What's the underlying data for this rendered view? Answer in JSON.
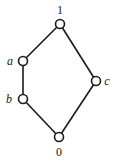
{
  "diagram": {
    "type": "hasse-diagram",
    "nodes": [
      {
        "id": "1",
        "label": "1",
        "x": 60,
        "y": 24,
        "lx": 60,
        "ly": 14,
        "italic": false
      },
      {
        "id": "a",
        "label": "a",
        "x": 23,
        "y": 61,
        "lx": 10,
        "ly": 65,
        "italic": true
      },
      {
        "id": "b",
        "label": "b",
        "x": 23,
        "y": 99,
        "lx": 9,
        "ly": 103,
        "italic": true
      },
      {
        "id": "c",
        "label": "c",
        "x": 96,
        "y": 81,
        "lx": 107,
        "ly": 85,
        "italic": true
      },
      {
        "id": "0",
        "label": "0",
        "x": 59,
        "y": 137,
        "lx": 59,
        "ly": 156,
        "italic": false
      }
    ],
    "edges": [
      {
        "from": "1",
        "to": "a"
      },
      {
        "from": "a",
        "to": "b"
      },
      {
        "from": "b",
        "to": "0"
      },
      {
        "from": "1",
        "to": "c"
      },
      {
        "from": "c",
        "to": "0"
      }
    ]
  }
}
